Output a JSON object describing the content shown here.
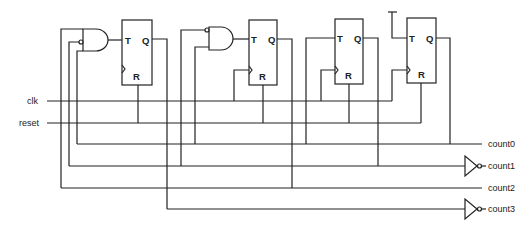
{
  "diagram": {
    "type": "circuit-schematic",
    "inputs": [
      {
        "id": "clk",
        "label": "clk"
      },
      {
        "id": "reset",
        "label": "reset"
      }
    ],
    "outputs": [
      {
        "id": "count0",
        "label": "count0",
        "inverted": false
      },
      {
        "id": "count1",
        "label": "count1",
        "inverted": true
      },
      {
        "id": "count2",
        "label": "count2",
        "inverted": false
      },
      {
        "id": "count3",
        "label": "count3",
        "inverted": true
      }
    ],
    "flip_flops": [
      {
        "id": "ff1",
        "pin_t": "T",
        "pin_q": "Q",
        "pin_r": "R"
      },
      {
        "id": "ff2",
        "pin_t": "T",
        "pin_q": "Q",
        "pin_r": "R"
      },
      {
        "id": "ff3",
        "pin_t": "T",
        "pin_q": "Q",
        "pin_r": "R"
      },
      {
        "id": "ff4",
        "pin_t": "T",
        "pin_q": "Q",
        "pin_r": "R"
      }
    ],
    "gates": [
      {
        "id": "and1",
        "type": "AND",
        "inputs": 3,
        "inverted_inputs": [
          2
        ]
      },
      {
        "id": "and2",
        "type": "AND",
        "inputs": 2,
        "inverted_inputs": [
          1
        ]
      },
      {
        "id": "inv1",
        "type": "NOT",
        "output": "count1"
      },
      {
        "id": "inv3",
        "type": "NOT",
        "output": "count3"
      }
    ],
    "colors": {
      "ink": "#222222",
      "background": "#ffffff"
    }
  }
}
